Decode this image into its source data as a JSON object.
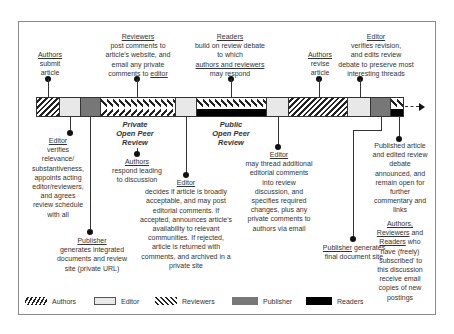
{
  "diagram": {
    "top_labels": [
      {
        "actor": "Authors",
        "lines": [
          "submit",
          "article"
        ]
      },
      {
        "actor": "Reviewers",
        "lines": [
          "post comments to",
          "article's website, and",
          "email any private",
          "comments to"
        ],
        "tail_actor": "editor"
      },
      {
        "actor": "Readers",
        "lines": [
          "build on review debate",
          "to which"
        ],
        "tail_actor": "authors and reviewers",
        "tail": "may respond"
      },
      {
        "actor": "Authors",
        "lines": [
          "revise",
          "article"
        ]
      },
      {
        "actor": "Editor",
        "lines": [
          "verifies revision,",
          "and edits review",
          "debate to preserve most",
          "interesting threads"
        ]
      }
    ],
    "phase_labels": [
      {
        "lines": [
          "Private",
          "Open Peer",
          "Review"
        ]
      },
      {
        "lines": [
          "Public",
          "Open Peer",
          "Review"
        ]
      }
    ],
    "bottom_labels": [
      {
        "actor": "Editor",
        "lines": [
          "verifies",
          "relevance/",
          "substantiveness,",
          "appoints acting",
          "editor/reviewers,",
          "and agrees",
          "review schedule",
          "with all"
        ]
      },
      {
        "actor": "Publisher",
        "lines": [
          "generates integrated",
          "documents and review",
          "site (private URL)"
        ]
      },
      {
        "actor": "Authors",
        "lines": [
          "respond leading",
          "to discussion"
        ]
      },
      {
        "actor": "Editor",
        "lines": [
          "decides if article is broadly",
          "acceptable, and may post",
          "editorial comments. If",
          "accepted, announces article's",
          "availability to relevant",
          "communities. If rejected,",
          "article is returned with",
          "comments, and archived in a",
          "private site"
        ]
      },
      {
        "actor": "Editor",
        "lines": [
          "may thread additional",
          "editorial comments",
          "into review",
          "discussion, and",
          "specifies required",
          "changes, plus any",
          "private comments to",
          "authors via email"
        ]
      },
      {
        "actor": "Publisher",
        "text": "generates",
        "lines": [
          "final document site"
        ]
      },
      {
        "lines": [
          "Published article",
          "and edited review",
          "debate",
          "announced, and",
          "remain open for",
          "further",
          "commentary and",
          "links"
        ]
      },
      {
        "actors": [
          "Authors,",
          "Reviewers",
          "Readers"
        ],
        "and": "and",
        "who": "who",
        "lines": [
          "have (freely)",
          "'subscribed' to",
          "this discussion",
          "receive email",
          "copies of new",
          "postings"
        ]
      }
    ],
    "legend": [
      {
        "label": "Authors",
        "pattern": "diagonal-hatch"
      },
      {
        "label": "Editor",
        "pattern": "dotted"
      },
      {
        "label": "Reviewers",
        "pattern": "chevron"
      },
      {
        "label": "Publisher",
        "color": "#777777"
      },
      {
        "label": "Readers",
        "color": "#000000"
      }
    ],
    "segments": [
      "Authors",
      "Editor",
      "Publisher",
      "Reviewers",
      "Editor",
      "Reviewers+Readers",
      "Editor",
      "Authors",
      "Editor",
      "Publisher",
      "Reviewers+Readers"
    ]
  }
}
